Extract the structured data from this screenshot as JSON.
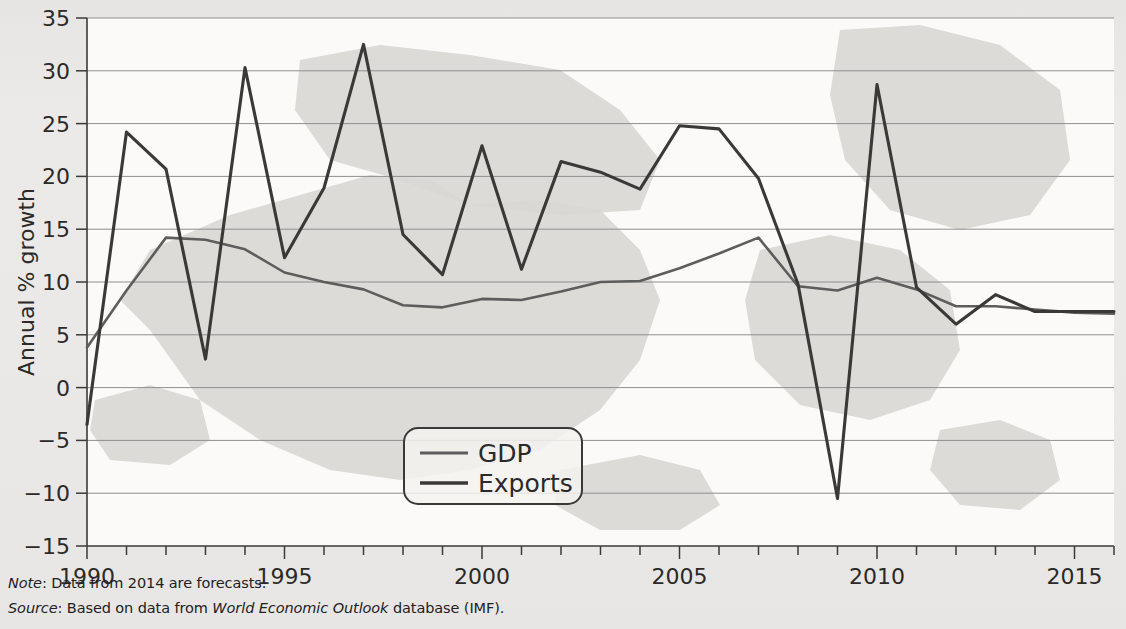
{
  "figure": {
    "note_prefix": "Note",
    "note_text": ": Data from 2014 are forecasts.",
    "source_prefix": "Source",
    "source_text_1": ": Based on data from ",
    "source_italic": "World Economic Outlook",
    "source_text_2": " database (IMF)."
  },
  "chart_data": {
    "type": "line",
    "title": "",
    "xlabel": "",
    "ylabel": "Annual % growth",
    "xlim": [
      1990,
      2016
    ],
    "ylim": [
      -15,
      35
    ],
    "yticks": [
      -15,
      -10,
      -5,
      0,
      5,
      10,
      15,
      20,
      25,
      30,
      35
    ],
    "ytick_labels": [
      "−15",
      "−10",
      "−5",
      "0",
      "5",
      "10",
      "15",
      "20",
      "25",
      "30",
      "35"
    ],
    "xticks": [
      1990,
      1991,
      1992,
      1993,
      1994,
      1995,
      1996,
      1997,
      1998,
      1999,
      2000,
      2001,
      2002,
      2003,
      2004,
      2005,
      2006,
      2007,
      2008,
      2009,
      2010,
      2011,
      2012,
      2013,
      2014,
      2015,
      2016
    ],
    "xtick_labels_shown": [
      1990,
      1995,
      2000,
      2005,
      2010,
      2015
    ],
    "grid": "horizontal",
    "legend_position": "lower-center",
    "x": [
      1990,
      1991,
      1992,
      1993,
      1994,
      1995,
      1996,
      1997,
      1998,
      1999,
      2000,
      2001,
      2002,
      2003,
      2004,
      2005,
      2006,
      2007,
      2008,
      2009,
      2010,
      2011,
      2012,
      2013,
      2014,
      2015,
      2016
    ],
    "series": [
      {
        "name": "GDP",
        "color": "#5d5d5d",
        "values": [
          3.8,
          9.2,
          14.2,
          14.0,
          13.1,
          10.9,
          10.0,
          9.3,
          7.8,
          7.6,
          8.4,
          8.3,
          9.1,
          10.0,
          10.1,
          11.3,
          12.7,
          14.2,
          9.6,
          9.2,
          10.4,
          9.3,
          7.7,
          7.7,
          7.4,
          7.1,
          7.0
        ],
        "linewidth": 2.6
      },
      {
        "name": "Exports",
        "color": "#3a3937",
        "values": [
          -3.5,
          24.2,
          20.7,
          2.7,
          30.3,
          12.3,
          18.9,
          32.5,
          14.5,
          10.7,
          22.9,
          11.2,
          21.4,
          20.4,
          18.8,
          24.8,
          24.5,
          19.8,
          9.8,
          -10.5,
          28.7,
          9.5,
          6.0,
          8.8,
          7.2,
          7.2,
          7.2
        ],
        "linewidth": 3.1
      }
    ],
    "legend": [
      {
        "label": "GDP",
        "color": "#5d5d5d"
      },
      {
        "label": "Exports",
        "color": "#3a3937"
      }
    ]
  }
}
